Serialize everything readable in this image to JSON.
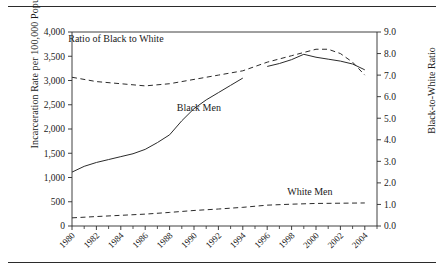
{
  "chart_data": {
    "type": "line",
    "title": "",
    "xlabel": "",
    "ylabel": "Incarceration Rate per 100,000 Population",
    "ylabel_right": "Black-to-White Ratio",
    "xlim": [
      1980,
      2005
    ],
    "ylim": [
      0,
      4000
    ],
    "ylim_right": [
      0.0,
      9.0
    ],
    "yticks": [
      "0",
      "500",
      "1,000",
      "1,500",
      "2,000",
      "2,500",
      "3,000",
      "3,500",
      "4,000"
    ],
    "ytick_values": [
      0,
      500,
      1000,
      1500,
      2000,
      2500,
      3000,
      3500,
      4000
    ],
    "yticks_right": [
      "0.0",
      "1.0",
      "2.0",
      "3.0",
      "4.0",
      "5.0",
      "6.0",
      "7.0",
      "8.0",
      "9.0"
    ],
    "ytick_values_right": [
      0,
      1,
      2,
      3,
      4,
      5,
      6,
      7,
      8,
      9
    ],
    "xticks": [
      "1980",
      "1982",
      "1984",
      "1986",
      "1988",
      "1990",
      "1992",
      "1994",
      "1996",
      "1998",
      "2000",
      "2002",
      "2004"
    ],
    "xtick_values": [
      1980,
      1982,
      1984,
      1986,
      1988,
      1990,
      1992,
      1994,
      1996,
      1998,
      2000,
      2002,
      2004
    ],
    "xtick_minor": [
      1981,
      1983,
      1985,
      1987,
      1989,
      1991,
      1993,
      1995,
      1997,
      1999,
      2001,
      2003,
      2005
    ],
    "grid": false,
    "legend_position": "inline-annotations",
    "series": [
      {
        "name": "Black Men",
        "label": "Black Men",
        "axis": "left",
        "style": "solid",
        "color": "#2b2b2b",
        "x": [
          1980,
          1981,
          1982,
          1983,
          1984,
          1985,
          1986,
          1987,
          1988,
          1989,
          1990,
          1991,
          1992,
          1993,
          1994,
          1996,
          1997,
          1998,
          1999,
          2000,
          2001,
          2002,
          2003,
          2004
        ],
        "values": [
          1111,
          1230,
          1310,
          1370,
          1430,
          1490,
          1580,
          1720,
          1880,
          2170,
          2420,
          2600,
          2750,
          2900,
          3050,
          3290,
          3350,
          3430,
          3540,
          3480,
          3440,
          3400,
          3340,
          3220
        ]
      },
      {
        "name": "White Men",
        "label": "White Men",
        "axis": "left",
        "style": "dashed",
        "color": "#2b2b2b",
        "x": [
          1980,
          1982,
          1984,
          1986,
          1988,
          1990,
          1992,
          1994,
          1996,
          1998,
          2000,
          2002,
          2004
        ],
        "values": [
          168,
          195,
          220,
          245,
          280,
          320,
          350,
          385,
          430,
          450,
          465,
          470,
          475
        ]
      },
      {
        "name": "Ratio of Black to White",
        "label": "Ratio of Black to White",
        "axis": "right",
        "style": "dashed",
        "color": "#2b2b2b",
        "x": [
          1980,
          1982,
          1984,
          1986,
          1988,
          1990,
          1992,
          1994,
          1996,
          1998,
          2000,
          2001,
          2002,
          2003,
          2004
        ],
        "values": [
          6.9,
          6.7,
          6.6,
          6.5,
          6.6,
          6.8,
          7.0,
          7.2,
          7.6,
          7.9,
          8.2,
          8.2,
          8.0,
          7.6,
          7.0
        ]
      }
    ],
    "annotations": [
      {
        "text": "Ratio of Black to White",
        "x": 1983.6,
        "y_axis_right": 8.55
      },
      {
        "text": "Black Men",
        "x": 1990.4,
        "y_axis_left": 2380
      },
      {
        "text": "White Men",
        "x": 1999.5,
        "y_axis_left": 640
      }
    ]
  }
}
